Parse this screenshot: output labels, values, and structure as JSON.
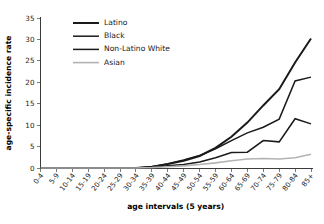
{
  "chart_data": {
    "type": "line",
    "title": "",
    "xlabel": "age intervals (5 years)",
    "ylabel": "age-specific incidence rate",
    "categories": [
      "0-4",
      "5-9",
      "10-14",
      "15-19",
      "20-24",
      "25-29",
      "30-34",
      "35-39",
      "40-44",
      "45-49",
      "50-54",
      "55-59",
      "60-64",
      "65-69",
      "70-74",
      "75-79",
      "80-84",
      "85+"
    ],
    "ylim": [
      0,
      35
    ],
    "yticks": [
      0,
      5,
      10,
      15,
      20,
      25,
      30,
      35
    ],
    "grid": false,
    "legend_position": "top-left",
    "series": [
      {
        "name": "Latino",
        "color": "#1a1a1a",
        "width": 2.0,
        "values": [
          0,
          0,
          0,
          0,
          0,
          0,
          0,
          0.3,
          0.9,
          1.7,
          2.8,
          4.7,
          7.3,
          10.6,
          14.6,
          18.4,
          24.6,
          30.2
        ]
      },
      {
        "name": "Black",
        "color": "#1a1a1a",
        "width": 1.5,
        "values": [
          0,
          0,
          0,
          0,
          0,
          0,
          0,
          0.3,
          1.0,
          1.9,
          2.9,
          4.5,
          6.4,
          8.2,
          9.5,
          11.4,
          20.3,
          21.2
        ]
      },
      {
        "name": "Non-Latino White",
        "color": "#1a1a1a",
        "width": 1.5,
        "values": [
          0,
          0,
          0,
          0,
          0,
          0,
          0,
          0.2,
          0.5,
          0.8,
          1.4,
          2.4,
          3.6,
          3.7,
          6.4,
          6.1,
          11.5,
          10.3
        ]
      },
      {
        "name": "Asian",
        "color": "#b3b3b3",
        "width": 1.6,
        "values": [
          0,
          0,
          0,
          0,
          0,
          0,
          0,
          0.1,
          0.3,
          0.5,
          0.8,
          1.2,
          1.7,
          2.1,
          2.2,
          2.1,
          2.4,
          3.2
        ]
      }
    ]
  },
  "legend": {
    "entries": [
      {
        "label": "Latino"
      },
      {
        "label": "Black"
      },
      {
        "label": "Non-Latino White"
      },
      {
        "label": "Asian"
      }
    ]
  },
  "axes": {
    "y_title": "age-specific incidence rate",
    "x_title": "age intervals (5 years)",
    "y_tick_labels": [
      "0",
      "5",
      "10",
      "15",
      "20",
      "25",
      "30",
      "35"
    ],
    "x_tick_labels": [
      "0-4",
      "5-9",
      "10-14",
      "15-19",
      "20-24",
      "25-29",
      "30-34",
      "35-39",
      "40-44",
      "45-49",
      "50-54",
      "55-59",
      "60-64",
      "65-69",
      "70-74",
      "75-79",
      "80-84",
      "85+"
    ]
  }
}
